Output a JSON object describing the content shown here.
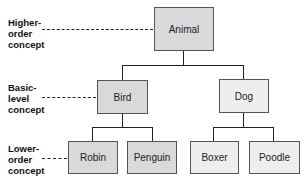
{
  "levels": [
    {
      "label_lines": [
        "Higher-",
        "order",
        "concept"
      ]
    },
    {
      "label_lines": [
        "Basic-",
        "level",
        "concept"
      ]
    },
    {
      "label_lines": [
        "Lower-",
        "order",
        "concept"
      ]
    }
  ],
  "nodes": {
    "animal": "Animal",
    "bird": "Bird",
    "dog": "Dog",
    "robin": "Robin",
    "penguin": "Penguin",
    "boxer": "Boxer",
    "poodle": "Poodle"
  },
  "colors": {
    "highlighted_fill": "#d9d9d9",
    "plain_fill": "#eeeeee",
    "line": "#222222"
  }
}
